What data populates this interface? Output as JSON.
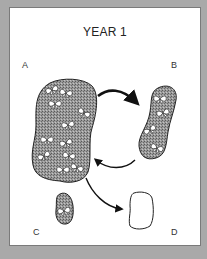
{
  "diagram": {
    "title": "YEAR 1",
    "patches": [
      {
        "id": "A",
        "label": "A",
        "state": "occupied",
        "size": "large",
        "butterflies": 11
      },
      {
        "id": "B",
        "label": "B",
        "state": "occupied",
        "size": "medium",
        "butterflies": 5
      },
      {
        "id": "C",
        "label": "C",
        "state": "occupied",
        "size": "small",
        "butterflies": 1
      },
      {
        "id": "D",
        "label": "D",
        "state": "empty",
        "size": "small",
        "butterflies": 0
      }
    ],
    "arrows": [
      {
        "from": "A",
        "to": "B"
      },
      {
        "from": "B",
        "to": "A"
      },
      {
        "from": "A",
        "to": "D"
      }
    ],
    "colors": {
      "background": "#a9a9a9",
      "panel": "#ffffff",
      "patch_fill": "#8c8c8c",
      "outline": "#222222"
    }
  }
}
